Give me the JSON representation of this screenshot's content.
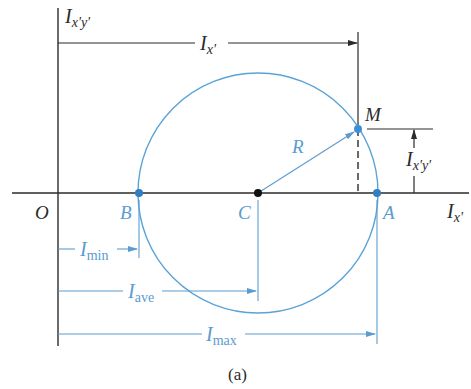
{
  "figure": {
    "caption": "(a)",
    "colors": {
      "axis": "#2b2b2b",
      "circle": "#5aa3d8",
      "blue_text": "#5b9bd0",
      "point_blue": "#2f7fc4",
      "center_point": "#111111"
    }
  },
  "axes": {
    "vertical_label_main": "I",
    "vertical_label_sub": "x'y'",
    "horizontal_label_main": "I",
    "horizontal_label_sub": "x'",
    "origin_label": "O"
  },
  "points": {
    "B": "B",
    "C": "C",
    "A": "A",
    "M": "M"
  },
  "labels": {
    "radius": "R",
    "ix_main": "I",
    "ix_sub": "x'",
    "ixy_main": "I",
    "ixy_sub": "x'y'",
    "imin_main": "I",
    "imin_sub": "min",
    "iave_main": "I",
    "iave_sub": "ave",
    "imax_main": "I",
    "imax_sub": "max"
  },
  "geometry": {
    "origin": [
      58,
      193
    ],
    "center_C": [
      258,
      193
    ],
    "radius": 120,
    "point_B": [
      139,
      193
    ],
    "point_A": [
      377,
      193
    ],
    "point_M": [
      358,
      129
    ]
  }
}
